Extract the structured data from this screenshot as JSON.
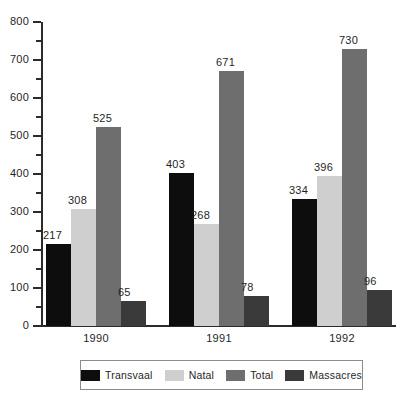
{
  "chart_data": {
    "type": "bar",
    "title": "",
    "subtitle": "",
    "xlabel": "",
    "ylabel": "",
    "categories": [
      "1990",
      "1991",
      "1992"
    ],
    "series": [
      {
        "name": "Transvaal",
        "color": "#0d0d0d",
        "values": [
          217,
          403,
          334
        ]
      },
      {
        "name": "Natal",
        "color": "#cfcfcf",
        "values": [
          308,
          268,
          396
        ]
      },
      {
        "name": "Total",
        "color": "#6e6e6e",
        "values": [
          525,
          671,
          730
        ]
      },
      {
        "name": "Massacres",
        "color": "#3a3a3a",
        "values": [
          65,
          78,
          96
        ]
      }
    ],
    "ylim": [
      0,
      800
    ],
    "ytick_labels": [
      "0",
      "100",
      "200",
      "300",
      "400",
      "500",
      "600",
      "700",
      "800"
    ],
    "ytick_values": [
      0,
      100,
      200,
      300,
      400,
      500,
      600,
      700,
      800
    ],
    "yminor_values": [
      50,
      150,
      250,
      350,
      450,
      550,
      650,
      750
    ],
    "grid": false,
    "legend_position": "bottom",
    "data_labels": true
  },
  "legend": {
    "entries": [
      {
        "label": "Transvaal",
        "swatch": "legend-swatch-transvaal"
      },
      {
        "label": "Natal",
        "swatch": "legend-swatch-natal"
      },
      {
        "label": "Total",
        "swatch": "legend-swatch-total"
      },
      {
        "label": "Massacres",
        "swatch": "legend-swatch-massacres"
      }
    ]
  },
  "colors": {
    "transvaal": "#0d0d0d",
    "natal": "#cfcfcf",
    "total": "#6e6e6e",
    "massacres": "#3a3a3a",
    "axis": "#2b2b2b",
    "text": "#1f1f1f",
    "legend_border": "#8c8c8c",
    "background": "#ffffff"
  }
}
